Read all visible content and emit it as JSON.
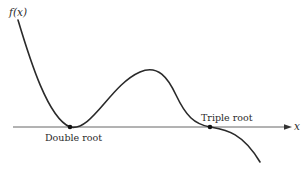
{
  "figure": {
    "y_axis_label": "f(x)",
    "x_axis_label": "x",
    "annotations": [
      {
        "label": "Double root",
        "x": 70,
        "y": 127
      },
      {
        "label": "Triple root",
        "x": 210,
        "y": 127
      }
    ],
    "colors": {
      "curve": "#2a2a2a",
      "axis": "#555555",
      "point": "#111111"
    }
  }
}
